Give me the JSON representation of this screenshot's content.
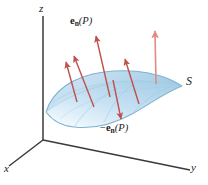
{
  "figure": {
    "background": "#ffffff",
    "width": 208,
    "height": 185
  },
  "axes": {
    "origin": {
      "x": 43,
      "y": 140
    },
    "z": {
      "label": "z",
      "tip": {
        "x": 43,
        "y": 16
      },
      "label_pos": {
        "x": 40,
        "y": 5
      }
    },
    "x": {
      "label": "x",
      "tip": {
        "x": 9,
        "y": 166
      },
      "label_pos": {
        "x": 4,
        "y": 165
      }
    },
    "y": {
      "label": "y",
      "tip": {
        "x": 190,
        "y": 170
      },
      "label_pos": {
        "x": 192,
        "y": 163
      }
    },
    "color": "#3a3a3a"
  },
  "surface": {
    "label": "S",
    "label_pos": {
      "x": 186,
      "y": 78
    },
    "fill_light": "#eaf4fb",
    "fill_mid": "#cfe6f5",
    "fill_dark": "#a8cfe6",
    "edge_color": "#7fb4d4",
    "mesh_color": "#9ec9e2"
  },
  "vectors": {
    "outward_label": "e_n(P)",
    "outward_label_html": {
      "bold": "e",
      "sub": "n",
      "arg": "(P)"
    },
    "outward_label_pos": {
      "x": 72,
      "y": 18
    },
    "inward_label": "-e_n(P)",
    "inward_label_html": {
      "prefix": "−",
      "bold": "e",
      "sub": "n",
      "arg": "(P)"
    },
    "inward_label_pos": {
      "x": 102,
      "y": 125
    },
    "color": "#c0504d",
    "color_light": "#e08b85",
    "arrows": [
      {
        "name": "normal-arrow-1",
        "x1": 94,
        "y1": 107,
        "x2": 74,
        "y2": 56,
        "color": "#c0504d"
      },
      {
        "name": "normal-arrow-2",
        "x1": 77,
        "y1": 102,
        "x2": 66,
        "y2": 62,
        "color": "#c0504d"
      },
      {
        "name": "normal-arrow-3",
        "x1": 110,
        "y1": 97,
        "x2": 96,
        "y2": 36,
        "color": "#c0504d"
      },
      {
        "name": "normal-arrow-4",
        "x1": 139,
        "y1": 104,
        "x2": 125,
        "y2": 59,
        "color": "#c0504d"
      },
      {
        "name": "normal-arrow-5",
        "x1": 156,
        "y1": 84,
        "x2": 155,
        "y2": 31,
        "color": "#e08b85"
      },
      {
        "name": "inward-normal-arrow",
        "x1": 113,
        "y1": 80,
        "x2": 121,
        "y2": 119,
        "color": "#c0504d"
      }
    ]
  }
}
